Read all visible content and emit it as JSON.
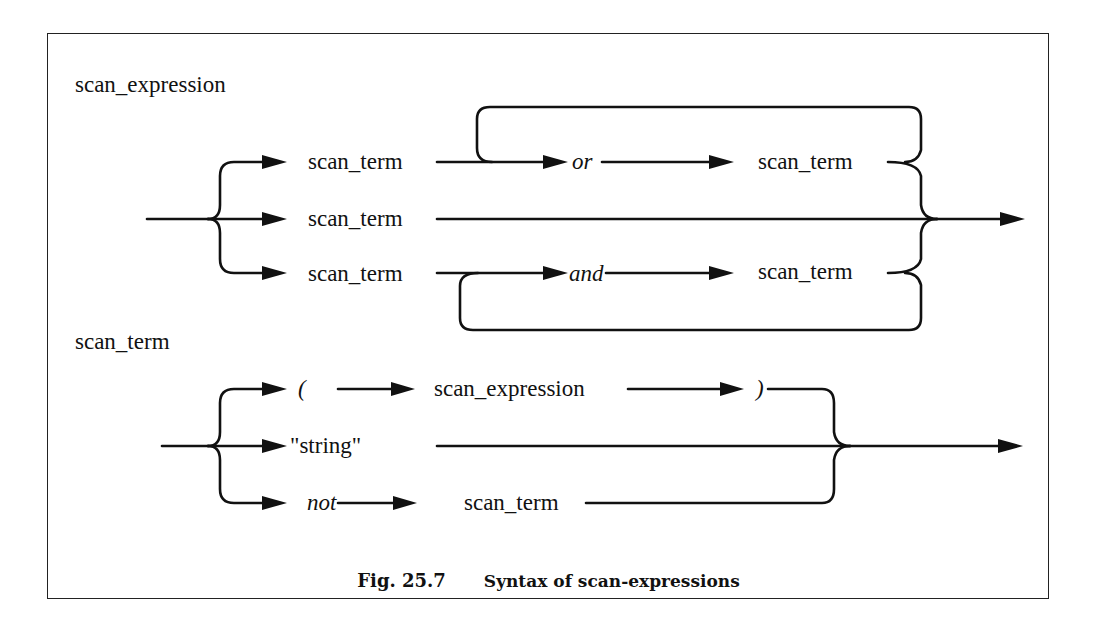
{
  "figure": {
    "number_label": "Fig. 25.7",
    "caption": "Syntax of scan-expressions"
  },
  "scan_expression_diagram": {
    "title": "scan_expression",
    "rows": [
      {
        "items": [
          "scan_term",
          "or",
          "scan_term"
        ],
        "loop": "repeat via or"
      },
      {
        "items": [
          "scan_term"
        ]
      },
      {
        "items": [
          "scan_term",
          "and",
          "scan_term"
        ],
        "loop": "repeat via and"
      }
    ],
    "labels": {
      "r1_term1": "scan_term",
      "r1_op": "or",
      "r1_term2": "scan_term",
      "r2_term": "scan_term",
      "r3_term1": "scan_term",
      "r3_op": "and",
      "r3_term2": "scan_term"
    }
  },
  "scan_term_diagram": {
    "title": "scan_term",
    "rows": [
      {
        "items": [
          "(",
          "scan_expression",
          ")"
        ]
      },
      {
        "items": [
          "\"string\""
        ]
      },
      {
        "items": [
          "not",
          "scan_term"
        ]
      }
    ],
    "labels": {
      "r1_open": "(",
      "r1_expr": "scan_expression",
      "r1_close": ")",
      "r2_string": "\"string\"",
      "r3_not": "not",
      "r3_term": "scan_term"
    }
  },
  "colors": {
    "line": "#111111",
    "background": "#ffffff",
    "frame": "#222222"
  }
}
